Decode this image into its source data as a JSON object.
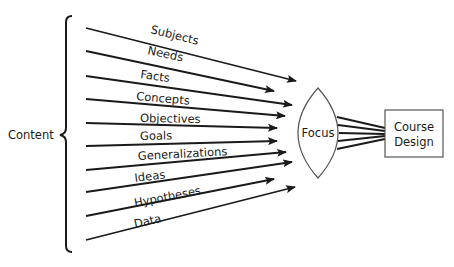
{
  "diagram": {
    "source_label": "Content",
    "inputs": [
      {
        "label": "Subjects",
        "x1": 86,
        "y1": 28,
        "x2": 296,
        "y2": 81,
        "lx": 150,
        "ly": 33,
        "rot": 14
      },
      {
        "label": "Needs",
        "x1": 86,
        "y1": 51,
        "x2": 274,
        "y2": 91,
        "lx": 147,
        "ly": 54,
        "rot": 12
      },
      {
        "label": "Facts",
        "x1": 86,
        "y1": 76,
        "x2": 292,
        "y2": 105,
        "lx": 140,
        "ly": 78,
        "rot": 8
      },
      {
        "label": "Concepts",
        "x1": 86,
        "y1": 99,
        "x2": 285,
        "y2": 116,
        "lx": 136,
        "ly": 100,
        "rot": 5
      },
      {
        "label": "Objectives",
        "x1": 86,
        "y1": 123,
        "x2": 277,
        "y2": 128,
        "lx": 140,
        "ly": 122,
        "rot": 1
      },
      {
        "label": "Goals",
        "x1": 86,
        "y1": 146,
        "x2": 277,
        "y2": 141,
        "lx": 140,
        "ly": 140,
        "rot": -1
      },
      {
        "label": "Generalizations",
        "x1": 86,
        "y1": 170,
        "x2": 286,
        "y2": 152,
        "lx": 138,
        "ly": 160,
        "rot": -3
      },
      {
        "label": "Ideas",
        "x1": 86,
        "y1": 192,
        "x2": 292,
        "y2": 162,
        "lx": 135,
        "ly": 182,
        "rot": -7
      },
      {
        "label": "Hypotheses",
        "x1": 86,
        "y1": 216,
        "x2": 274,
        "y2": 179,
        "lx": 135,
        "ly": 207,
        "rot": -11
      },
      {
        "label": "Data",
        "x1": 86,
        "y1": 240,
        "x2": 295,
        "y2": 187,
        "lx": 135,
        "ly": 228,
        "rot": -13
      }
    ],
    "lens": {
      "label": "Focus"
    },
    "output": {
      "label_line1": "Course",
      "label_line2": "Design"
    },
    "colors": {
      "stroke": "#1a1a1a",
      "lens_stroke": "#555555",
      "box_stroke": "#555555"
    }
  }
}
